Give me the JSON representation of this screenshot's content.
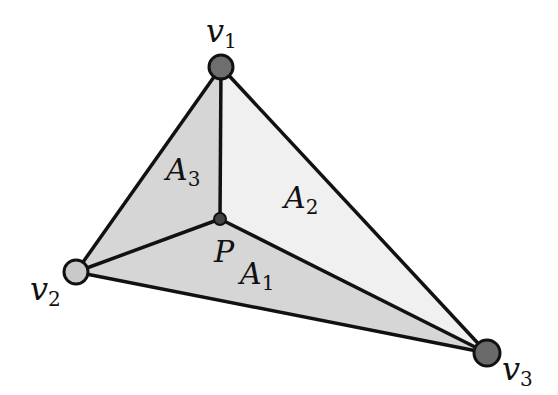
{
  "diagram": {
    "vertices": {
      "v1": {
        "name": "v",
        "sub": "1",
        "x": 221,
        "y": 67,
        "fill": "#6e6e6e"
      },
      "v2": {
        "name": "v",
        "sub": "2",
        "x": 76,
        "y": 272,
        "fill": "#c9c9c9"
      },
      "v3": {
        "name": "v",
        "sub": "3",
        "x": 487,
        "y": 353,
        "fill": "#6a6a6a"
      }
    },
    "point": {
      "name": "P",
      "x": 220,
      "y": 219,
      "fill": "#444444"
    },
    "regions": {
      "A1": {
        "name": "A",
        "sub": "1",
        "fill": "#d6d6d6"
      },
      "A2": {
        "name": "A",
        "sub": "2",
        "fill": "#f0f0f0"
      },
      "A3": {
        "name": "A",
        "sub": "3",
        "fill": "#d6d6d6"
      }
    },
    "colors": {
      "stroke": "#111111",
      "background": "#ffffff"
    }
  }
}
